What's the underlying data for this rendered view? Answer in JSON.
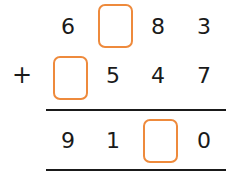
{
  "problem": {
    "operator": "+",
    "row1": [
      "6",
      "",
      "8",
      "3"
    ],
    "row2": [
      "",
      "5",
      "4",
      "7"
    ],
    "result": [
      "9",
      "1",
      "",
      "0"
    ]
  },
  "colors": {
    "box_border": "#ee8a3c",
    "text": "#1a1a1a"
  }
}
